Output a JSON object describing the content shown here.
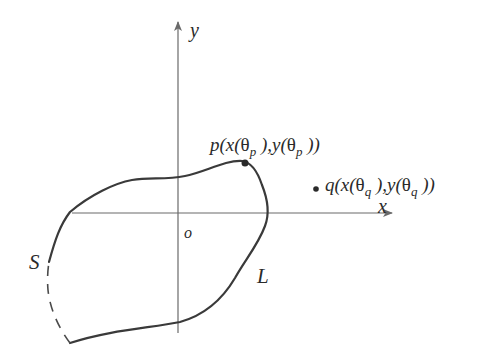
{
  "diagram": {
    "type": "closed curve in Cartesian plane with exterior point",
    "axes": {
      "x_label": "x",
      "y_label": "y",
      "origin_label": "o"
    },
    "curve": {
      "name": "L",
      "segment_name": "S",
      "segment_style": "dashed"
    },
    "points": {
      "p": {
        "name": "p",
        "prefix": "p(x(",
        "theta": "θ",
        "subscript": "p",
        "middle": " ),y(",
        "suffix": " ))",
        "location": "on curve"
      },
      "q": {
        "name": "q",
        "prefix": "q(x(",
        "theta": "θ",
        "subscript": "q",
        "middle": " ),y(",
        "suffix": " ))",
        "location": "outside curve"
      }
    },
    "colors": {
      "stroke": "#3a3a3a",
      "axis": "#6a6a6a",
      "text": "#2a2a2a",
      "background": "#ffffff"
    }
  }
}
